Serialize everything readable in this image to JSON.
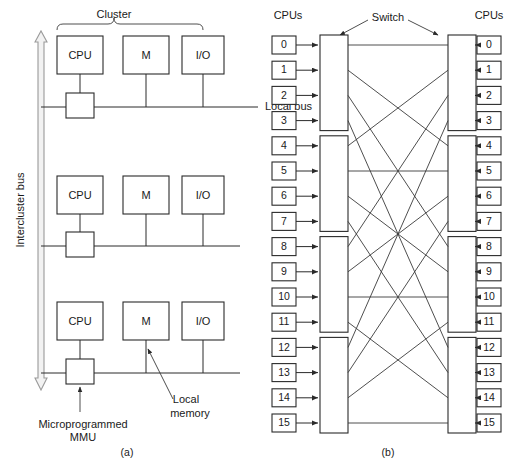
{
  "figure": {
    "panel_a": {
      "caption": "(a)",
      "cluster_label": "Cluster",
      "bus_label": "Intercluster bus",
      "local_bus_label": "Local bus",
      "local_memory_label_line1": "Local",
      "local_memory_label_line2": "memory",
      "mmu_label_line1": "Microprogrammed",
      "mmu_label_line2": "MMU",
      "clusters": [
        {
          "nodes": [
            "CPU",
            "M",
            "I/O"
          ],
          "has_mmu": true
        },
        {
          "nodes": [
            "CPU",
            "M",
            "I/O"
          ],
          "has_mmu": true
        },
        {
          "nodes": [
            "CPU",
            "M",
            "I/O"
          ],
          "has_mmu": true
        }
      ]
    },
    "panel_b": {
      "caption": "(b)",
      "left_header": "CPUs",
      "right_header": "CPUs",
      "switch_label": "Switch",
      "left_cpus": [
        "0",
        "1",
        "2",
        "3",
        "4",
        "5",
        "6",
        "7",
        "8",
        "9",
        "10",
        "11",
        "12",
        "13",
        "14",
        "15"
      ],
      "right_cpus": [
        "0",
        "1",
        "2",
        "3",
        "4",
        "5",
        "6",
        "7",
        "8",
        "9",
        "10",
        "11",
        "12",
        "13",
        "14",
        "15"
      ],
      "stage1_switch_count": 4,
      "stage2_switch_count": 4,
      "switch_size": "4x4",
      "permutation_name": "perfect-shuffle",
      "permutation_map": [
        0,
        4,
        8,
        12,
        1,
        5,
        9,
        13,
        2,
        6,
        10,
        14,
        3,
        7,
        11,
        15
      ]
    }
  },
  "colors": {
    "line": "#2a2a2a",
    "bus_fill": "#f2f2f2",
    "bus_stroke": "#9a9a9a",
    "background": "#ffffff",
    "text": "#1a1a1a"
  }
}
